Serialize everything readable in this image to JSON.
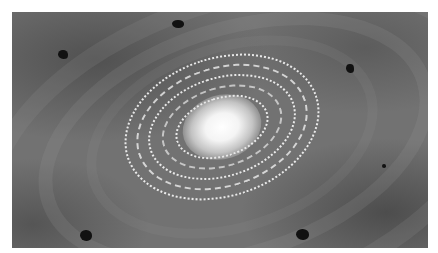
{
  "image": {
    "subject": "spiral galaxy illustration",
    "description": "Grayscale illustration of a spiral galaxy with a bright white core and dotted white spiral rings on a gray mottled background with several small dark blobs",
    "colors": {
      "background": "#727272",
      "core": "#ffffff",
      "rings": "#ffffff",
      "blobs": "#111111",
      "page": "#ffffff"
    }
  }
}
